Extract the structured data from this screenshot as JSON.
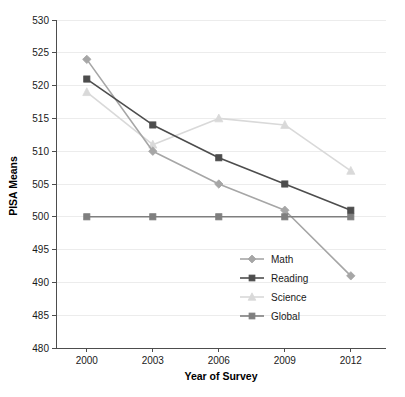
{
  "chart_data": {
    "type": "line",
    "title": "",
    "xlabel": "Year of Survey",
    "ylabel": "PISA Means",
    "categories": [
      2000,
      2003,
      2006,
      2009,
      2012
    ],
    "x": [
      2000,
      2003,
      2006,
      2009,
      2012
    ],
    "xtick_labels": [
      "2000",
      "2003",
      "2006",
      "2009",
      "2012"
    ],
    "ytick_labels": [
      "480",
      "485",
      "490",
      "495",
      "500",
      "505",
      "510",
      "515",
      "520",
      "525",
      "530"
    ],
    "yticks": [
      480,
      485,
      490,
      495,
      500,
      505,
      510,
      515,
      520,
      525,
      530
    ],
    "ylim": [
      480,
      530
    ],
    "xlim": [
      1998.6,
      2013.6
    ],
    "grid": true,
    "legend_position": "inside-lower-right",
    "series": [
      {
        "name": "Math",
        "values": [
          524,
          510,
          505,
          501,
          491
        ],
        "color": "#a6a6a6",
        "marker": "diamond"
      },
      {
        "name": "Reading",
        "values": [
          521,
          514,
          509,
          505,
          501
        ],
        "color": "#4d4d4d",
        "marker": "square"
      },
      {
        "name": "Science",
        "values": [
          519,
          511,
          515,
          514,
          507
        ],
        "color": "#d9d9d9",
        "marker": "triangle"
      },
      {
        "name": "Global",
        "values": [
          500,
          500,
          500,
          500,
          500
        ],
        "color": "#7f7f7f",
        "marker": "square"
      }
    ]
  },
  "axes": {
    "y_title": "PISA Means",
    "x_title": "Year of Survey"
  },
  "legend": {
    "entries": [
      {
        "label": "Math"
      },
      {
        "label": "Reading"
      },
      {
        "label": "Science"
      },
      {
        "label": "Global"
      }
    ]
  }
}
